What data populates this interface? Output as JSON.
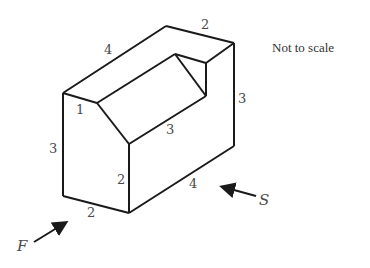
{
  "figure": {
    "title_note": "Not to scale",
    "stroke_color": "#1a1a1a",
    "label_color": "#4a4a4a",
    "dimension_labels": {
      "top_left_edge": "4",
      "top_back_edge": "2",
      "right_vertical_edge": "3",
      "slope_edge": "1",
      "left_vertical_edge": "3",
      "ridge_length": "3",
      "front_vertical_edge": "2",
      "bottom_right_edge": "4",
      "bottom_front_edge": "2"
    },
    "view_arrows": {
      "front": "F",
      "side": "S"
    }
  }
}
